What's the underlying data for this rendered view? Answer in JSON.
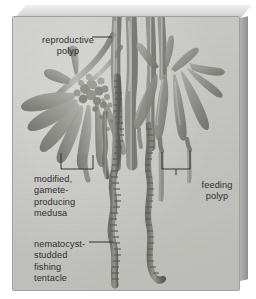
{
  "figure": {
    "background_color": "#ffffff",
    "plate_color": "#c6c6c2",
    "ink_color": "#2e2e2e"
  },
  "labels": {
    "reproductive_polyp": "reproductive\npolyp",
    "medusa": "modified,\ngamete-\nproducing\nmedusa",
    "nematocyst": "nematocyst-\nstudded\nfishing\ntentacle",
    "feeding_polyp": "feeding\npolyp"
  },
  "leaders": [
    {
      "name": "reproductive-polyp-leader",
      "type": "line"
    },
    {
      "name": "medusa-bracket",
      "type": "bracket"
    },
    {
      "name": "nematocyst-leader",
      "type": "line"
    },
    {
      "name": "feeding-polyp-bracket",
      "type": "bracket"
    }
  ],
  "illustration": {
    "subject": "siphonophore colony",
    "parts": [
      "reproductive polyp",
      "modified gamete-producing medusa",
      "feeding polyp",
      "nematocyst-studded fishing tentacle"
    ]
  }
}
